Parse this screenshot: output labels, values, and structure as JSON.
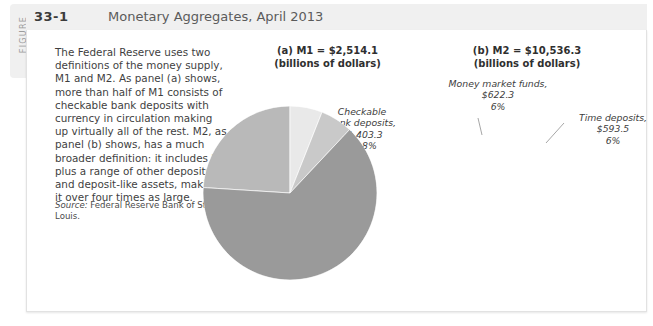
{
  "figure": {
    "tab_label": "FIGURE",
    "number": "33-1",
    "title": "Monetary Aggregates, April 2013"
  },
  "body": {
    "paragraph": "The Federal Reserve uses two definitions of the money supply, M1 and M2. As panel (a) shows, more than half of M1 consists of checkable bank deposits with currency in circulation making up virtually all of the rest. M2, as panel (b) shows, has a much broader definition: it includes M1 plus a range of other deposits and deposit-like assets, making it over four times as large.",
    "source_prefix": "Source:",
    "source_text": " Federal Reserve Bank of St. Louis."
  },
  "panels": {
    "a": {
      "heading_line1": "(a) M1 = $2,514.1",
      "heading_line2": "(billions of dollars)"
    },
    "b": {
      "heading_line1": "(b) M2 = $10,536.3",
      "heading_line2": "(billions of dollars)"
    }
  },
  "labels": {
    "currency": "Currency in\ncirculation,\n$1,107.1\n44%",
    "checkable": "Checkable\nbank deposits,\n$1,403.3\n55.8%",
    "travelers": "Traveler's checks,\n$3.7\n0.2%",
    "money_market": "Money market funds,\n$622.3\n6%",
    "time_deposits": "Time deposits,\n$593.5\n6%",
    "m1": "M1,\n$2,514.1\n24%",
    "savings": "Savings deposits,\n$6,806.3\n64%"
  },
  "colors": {
    "light_gray": "#e9e9e9",
    "mid_light_gray": "#d9d9d9",
    "mid_gray": "#b9b9b9",
    "dark_gray": "#9a9a9a",
    "header_bg": "#f0f0f0",
    "text": "#3f3f3f"
  },
  "chart_data": [
    {
      "type": "pie",
      "title": "(a) M1 = $2,514.1 (billions of dollars)",
      "unit": "billions of dollars",
      "total": 2514.1,
      "categories": [
        "Currency in circulation",
        "Checkable bank deposits",
        "Traveler's checks"
      ],
      "values": [
        1107.1,
        1403.3,
        3.7
      ],
      "percents": [
        44.0,
        55.8,
        0.2
      ],
      "colors": [
        "#e9e9e9",
        "#b9b9b9",
        "#d9d9d9"
      ],
      "legend": "labels-outside",
      "grid": false
    },
    {
      "type": "pie",
      "title": "(b) M2 = $10,536.3 (billions of dollars)",
      "unit": "billions of dollars",
      "total": 10536.3,
      "categories": [
        "M1",
        "Money market funds",
        "Time deposits",
        "Savings deposits"
      ],
      "values": [
        2514.1,
        622.3,
        593.5,
        6806.3
      ],
      "percents": [
        24,
        6,
        6,
        64
      ],
      "colors": [
        "#b9b9b9",
        "#e9e9e9",
        "#c9c9c9",
        "#9a9a9a"
      ],
      "legend": "labels-inside-and-outside",
      "grid": false
    }
  ]
}
